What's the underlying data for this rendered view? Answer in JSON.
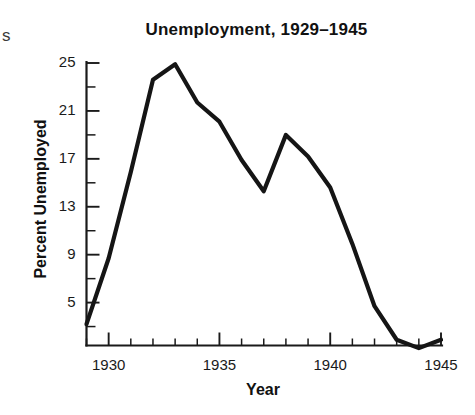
{
  "figure": {
    "title": "Unemployment, 1929–1945",
    "edge_fragment": "s",
    "background_color": "#ffffff",
    "line_color": "#151515",
    "axis_color": "#1a1a1a"
  },
  "chart_data": {
    "type": "line",
    "title": "Unemployment, 1929–1945",
    "subtitle": "",
    "xlabel": "Year",
    "ylabel": "Percent Unemployed",
    "x": [
      1929,
      1930,
      1931,
      1932,
      1933,
      1934,
      1935,
      1936,
      1937,
      1938,
      1939,
      1940,
      1941,
      1942,
      1943,
      1944,
      1945
    ],
    "values": [
      3.2,
      8.7,
      15.9,
      23.6,
      24.9,
      21.7,
      20.1,
      16.9,
      14.3,
      19.0,
      17.2,
      14.6,
      9.9,
      4.7,
      1.9,
      1.2,
      1.9
    ],
    "series": [
      {
        "name": "Percent Unemployed",
        "values": [
          3.2,
          8.7,
          15.9,
          23.6,
          24.9,
          21.7,
          20.1,
          16.9,
          14.3,
          19.0,
          17.2,
          14.6,
          9.9,
          4.7,
          1.9,
          1.2,
          1.9
        ]
      }
    ],
    "xlim": [
      1929,
      1945
    ],
    "ylim": [
      0.4,
      25.6
    ],
    "xticks": [
      1930,
      1935,
      1940,
      1945
    ],
    "xtick_labels": [
      "1930",
      "1935",
      "1940",
      "1945"
    ],
    "xticks_minor": [
      1929,
      1931,
      1932,
      1933,
      1934,
      1936,
      1937,
      1938,
      1939,
      1941,
      1942,
      1943,
      1944
    ],
    "yticks": [
      5,
      9,
      13,
      17,
      21,
      25
    ],
    "ytick_labels": [
      "5",
      "9",
      "13",
      "17",
      "21",
      "25"
    ],
    "yticks_minor": [
      3,
      7,
      11,
      15,
      19,
      23
    ],
    "grid": false,
    "legend": false,
    "legend_position": "none"
  },
  "axes": {
    "y_tick_labels": [
      "25",
      "21",
      "17",
      "13",
      "9",
      "5"
    ],
    "x_tick_labels": [
      "1930",
      "1935",
      "1940",
      "1945"
    ]
  }
}
